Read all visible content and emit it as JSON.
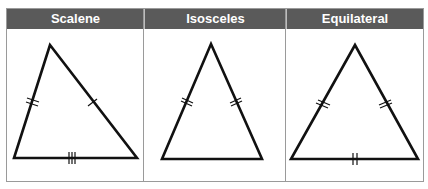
{
  "columns": [
    {
      "label": "Scalene"
    },
    {
      "label": "Isosceles"
    },
    {
      "label": "Equilateral"
    }
  ],
  "triangles": {
    "scalene": {
      "left_side_ticks": 2,
      "right_side_ticks": 1,
      "base_ticks": 3
    },
    "isosceles": {
      "left_side_ticks": 2,
      "right_side_ticks": 2,
      "base_ticks": 0
    },
    "equilateral": {
      "left_side_ticks": 2,
      "right_side_ticks": 2,
      "base_ticks": 2
    }
  },
  "colors": {
    "header_bg": "#5a5a5a",
    "header_text": "#ffffff",
    "stroke": "#111111",
    "border": "#9a9a9a"
  }
}
